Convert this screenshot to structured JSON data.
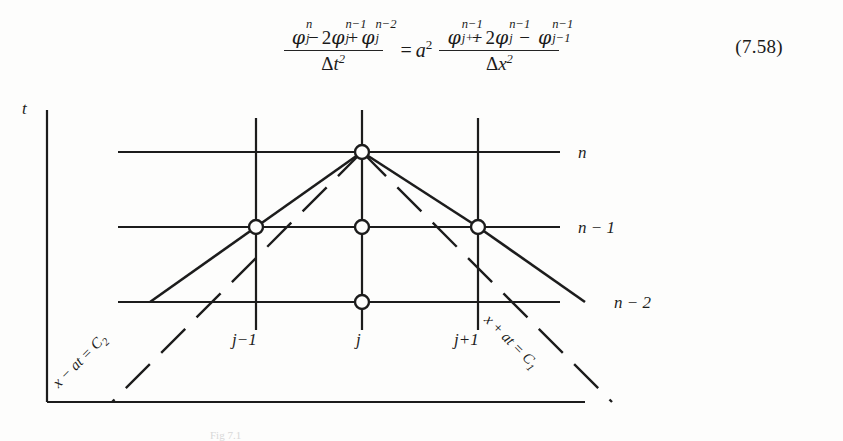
{
  "document": {
    "type": "textbook-figure-scan",
    "page_background": "#fdfdfc",
    "ink_color": "#1d1d1d"
  },
  "equation": {
    "number": "(7.58)",
    "relation": "=",
    "coefficient": "a",
    "coefficient_exponent": "2",
    "left": {
      "numerator_plain": "φⱼⁿ − 2φⱼⁿ⁻¹ + φⱼⁿ⁻²",
      "denominator_plain": "Δt²",
      "terms": [
        {
          "symbol": "φ",
          "sub": "j",
          "sup": "n",
          "coef": "",
          "sign": ""
        },
        {
          "symbol": "φ",
          "sub": "j",
          "sup": "n−1",
          "coef": "2",
          "sign": "−"
        },
        {
          "symbol": "φ",
          "sub": "j",
          "sup": "n−2",
          "coef": "",
          "sign": "+"
        }
      ],
      "denominator": {
        "delta": "Δ",
        "variable": "t",
        "exponent": "2"
      }
    },
    "right": {
      "numerator_plain": "φⱼ₊₁ⁿ⁻¹ − 2φⱼⁿ⁻¹ − φⱼ₋₁ⁿ⁻¹",
      "denominator_plain": "Δx²",
      "terms": [
        {
          "symbol": "φ",
          "sub": "j+1",
          "sup": "n−1",
          "coef": "",
          "sign": ""
        },
        {
          "symbol": "φ",
          "sub": "j",
          "sup": "n−1",
          "coef": "2",
          "sign": "−"
        },
        {
          "symbol": "φ",
          "sub": "j−1",
          "sup": "n−1",
          "coef": "",
          "sign": "−"
        }
      ],
      "denominator": {
        "delta": "Δ",
        "variable": "x",
        "exponent": "2"
      }
    }
  },
  "figure": {
    "caption": "Fig 7.1",
    "axes": {
      "vertical_label": "t",
      "horizontal_label": ""
    },
    "time_levels": [
      {
        "label": "n",
        "y": 60
      },
      {
        "label": "n − 1",
        "y": 135
      },
      {
        "label": "n − 2",
        "y": 210
      }
    ],
    "space_nodes": [
      {
        "label": "j−1",
        "x": 256
      },
      {
        "label": "j",
        "x": 362
      },
      {
        "label": "j+1",
        "x": 478
      }
    ],
    "characteristics": [
      {
        "label": "x − at = C",
        "subscript": "2",
        "side": "left"
      },
      {
        "label": "x + at = C",
        "subscript": "1",
        "side": "right"
      }
    ],
    "grid_nodes": [
      {
        "x": 362,
        "y": 60,
        "level": "n",
        "space": "j"
      },
      {
        "x": 256,
        "y": 135,
        "level": "n − 1",
        "space": "j−1"
      },
      {
        "x": 362,
        "y": 135,
        "level": "n − 1",
        "space": "j"
      },
      {
        "x": 478,
        "y": 135,
        "level": "n − 1",
        "space": "j+1"
      },
      {
        "x": 362,
        "y": 210,
        "level": "n − 2",
        "space": "j"
      }
    ]
  }
}
